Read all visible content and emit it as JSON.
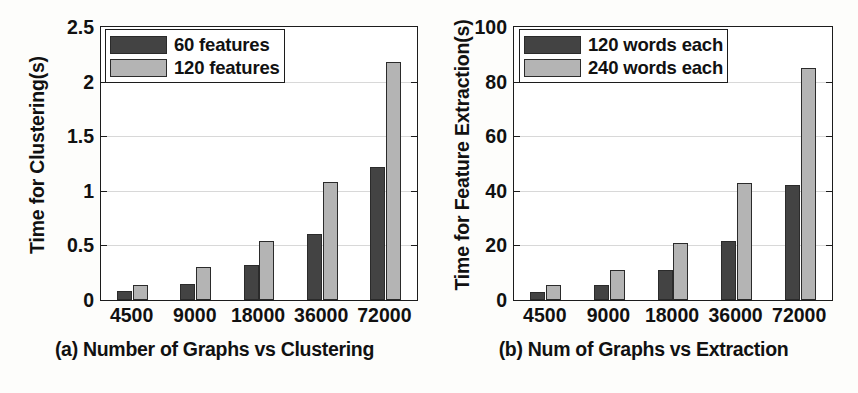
{
  "figure": {
    "background": "#fdfdfb",
    "series_colors": {
      "dark": "#434343",
      "light": "#b4b4b4"
    }
  },
  "panels": [
    {
      "key": "a",
      "caption": "(a) Number of Graphs vs Clustering",
      "ylabel": "Time for Clustering(s)",
      "legend": [
        {
          "label": "60 features",
          "color": "#434343"
        },
        {
          "label": "120 features",
          "color": "#b4b4b4"
        }
      ]
    },
    {
      "key": "b",
      "caption": "(b) Num of Graphs vs Extraction",
      "ylabel": "Time for Feature Extraction(s)",
      "legend": [
        {
          "label": "120 words each",
          "color": "#434343"
        },
        {
          "label": "240 words each",
          "color": "#b4b4b4"
        }
      ]
    }
  ],
  "chart_data": [
    {
      "type": "bar",
      "panel": "a",
      "title": "(a) Number of Graphs vs Clustering",
      "xlabel": "",
      "ylabel": "Time for Clustering(s)",
      "categories": [
        "4500",
        "9000",
        "18000",
        "36000",
        "72000"
      ],
      "series": [
        {
          "name": "60 features",
          "color": "#434343",
          "values": [
            0.08,
            0.15,
            0.32,
            0.6,
            1.22
          ]
        },
        {
          "name": "120 features",
          "color": "#b4b4b4",
          "values": [
            0.14,
            0.3,
            0.54,
            1.08,
            2.18
          ]
        }
      ],
      "ylim": [
        0,
        2.5
      ],
      "yticks": [
        0,
        0.5,
        1,
        1.5,
        2,
        2.5
      ],
      "ytick_labels": [
        "0",
        "0.5",
        "1",
        "1.5",
        "2",
        "2.5"
      ],
      "grid": true,
      "legend_position": "top-left"
    },
    {
      "type": "bar",
      "panel": "b",
      "title": "(b) Num of Graphs vs Extraction",
      "xlabel": "",
      "ylabel": "Time for Feature Extraction(s)",
      "categories": [
        "4500",
        "9000",
        "18000",
        "36000",
        "72000"
      ],
      "series": [
        {
          "name": "120 words each",
          "color": "#434343",
          "values": [
            3,
            5.5,
            11,
            21.5,
            42
          ]
        },
        {
          "name": "240 words each",
          "color": "#b4b4b4",
          "values": [
            5.5,
            11,
            21,
            43,
            85
          ]
        }
      ],
      "ylim": [
        0,
        100
      ],
      "yticks": [
        0,
        20,
        40,
        60,
        80,
        100
      ],
      "ytick_labels": [
        "0",
        "20",
        "40",
        "60",
        "80",
        "100"
      ],
      "grid": true,
      "legend_position": "top-left"
    }
  ]
}
